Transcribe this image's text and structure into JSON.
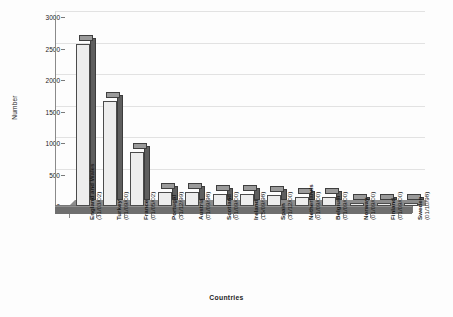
{
  "chart_data": {
    "type": "bar",
    "title": "",
    "xlabel": "Countries",
    "ylabel": "Number",
    "ylim": [
      0,
      3000
    ],
    "ytick_step": 500,
    "yticks": [
      "0",
      "500",
      "1000",
      "1500",
      "2000",
      "2500",
      "3000"
    ],
    "grid": true,
    "legend": "none",
    "style": "3d-column",
    "categories": [
      "England and Wales\n(31/03/02)",
      "Turkey\n(01/09/00)",
      "France\n(01/05/02)",
      "Portugal\n(31/12/99)",
      "Austria\n(01/09/98)",
      "Scotland\n(01/09/00)",
      "Ireland\n(15/09/98)",
      "Spain\n(31/12/00)",
      "Netherlands\n(01/09/00)",
      "Belgium\n(01/09/00)",
      "Norway\n(01/09/00)",
      "Finland\n(01/09/00)",
      "Sweden\n(01/10/98)"
    ],
    "values": [
      2570,
      1660,
      860,
      220,
      215,
      190,
      190,
      175,
      150,
      140,
      20,
      20,
      20
    ],
    "bars": [
      {
        "country": "England and Wales",
        "date": "(31/03/02)",
        "value": 2570
      },
      {
        "country": "Turkey",
        "date": "(01/09/00)",
        "value": 1660
      },
      {
        "country": "France",
        "date": "(01/05/02)",
        "value": 860
      },
      {
        "country": "Portugal",
        "date": "(31/12/99)",
        "value": 220
      },
      {
        "country": "Austria",
        "date": "(01/09/98)",
        "value": 215
      },
      {
        "country": "Scotland",
        "date": "(01/09/00)",
        "value": 190
      },
      {
        "country": "Ireland",
        "date": "(15/09/98)",
        "value": 190
      },
      {
        "country": "Spain",
        "date": "(31/12/00)",
        "value": 175
      },
      {
        "country": "Netherlands",
        "date": "(01/09/00)",
        "value": 150
      },
      {
        "country": "Belgium",
        "date": "(01/09/00)",
        "value": 140
      },
      {
        "country": "Norway",
        "date": "(01/09/00)",
        "value": 20
      },
      {
        "country": "Finland",
        "date": "(01/09/00)",
        "value": 20
      },
      {
        "country": "Sweden",
        "date": "(01/10/98)",
        "value": 20
      }
    ],
    "colors": {
      "bar_front": "#ededed",
      "bar_side": "#5e5e5e",
      "bar_top": "#9a9a9a",
      "bar_outline": "#4b4b4b",
      "gridline": "#e2e2e2",
      "axis": "#8a8a8a",
      "floor": "#7d7d7d",
      "background": "#fdfdfd",
      "text": "#1d1d1d"
    }
  }
}
